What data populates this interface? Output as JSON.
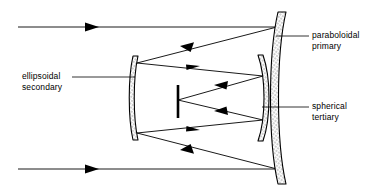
{
  "diagram": {
    "type": "optical-ray-diagram",
    "background_color": "#ffffff",
    "line_color": "#000000",
    "mirror_fill": "#d9d9d9",
    "labels": {
      "primary": {
        "line1": "paraboloidal",
        "line2": "primary"
      },
      "tertiary": {
        "line1": "spherical",
        "line2": "tertiary"
      },
      "secondary": {
        "line1": "ellipsoidal",
        "line2": "secondary"
      }
    },
    "elements": {
      "primary_mirror": "paraboloidal primary mirror",
      "secondary_mirror": "ellipsoidal secondary mirror",
      "tertiary_mirror": "spherical tertiary mirror",
      "focal_plane": "focal plane bar",
      "incoming_ray_top": "collimated input ray, top",
      "incoming_ray_bottom": "collimated input ray, bottom"
    }
  }
}
